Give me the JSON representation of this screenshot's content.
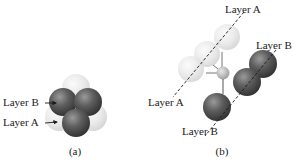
{
  "figure": {
    "panel_a": {
      "caption": "(a)",
      "labels": [
        {
          "id": "layer-b",
          "text": "Layer B"
        },
        {
          "id": "layer-a",
          "text": "Layer A"
        }
      ]
    },
    "panel_b": {
      "caption": "(b)",
      "labels": [
        {
          "id": "layer-a-top",
          "text": "Layer A"
        },
        {
          "id": "layer-b-right",
          "text": "Layer B"
        },
        {
          "id": "layer-a-left",
          "text": "Layer A"
        },
        {
          "id": "layer-b-bottom",
          "text": "Layer B"
        }
      ]
    },
    "colors": {
      "layer_a_sphere": "#e4e4e4",
      "layer_b_sphere": "#555555",
      "center_sphere": "#bdbdbd",
      "text": "#1a1a1a"
    }
  }
}
